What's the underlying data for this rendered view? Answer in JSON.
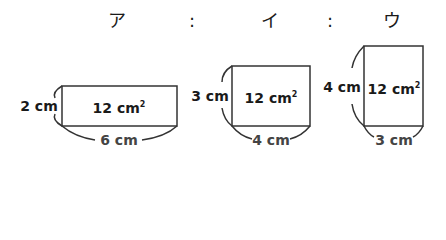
{
  "header": {
    "items": [
      {
        "label": "ア",
        "x": 117
      },
      {
        "label": ":",
        "x": 192
      },
      {
        "label": "イ",
        "x": 270
      },
      {
        "label": ":",
        "x": 330
      },
      {
        "label": "ウ",
        "x": 392
      }
    ]
  },
  "rectangles": [
    {
      "name": "ア",
      "area_value": "12 cm",
      "area_exp": "2",
      "height_label": "2 cm",
      "width_label": "6 cm",
      "box": {
        "left": 62,
        "top": 86,
        "right": 177,
        "bottom": 126
      }
    },
    {
      "name": "イ",
      "area_value": "12 cm",
      "area_exp": "2",
      "height_label": "3 cm",
      "width_label": "4 cm",
      "box": {
        "left": 232,
        "top": 66,
        "right": 310,
        "bottom": 126
      }
    },
    {
      "name": "ウ",
      "area_value": "12 cm",
      "area_exp": "2",
      "height_label": "4 cm",
      "width_label": "3 cm",
      "box": {
        "left": 364,
        "top": 46,
        "right": 423,
        "bottom": 126
      }
    }
  ],
  "colors": {
    "line": "#333333",
    "text": "#1a1a1a"
  }
}
